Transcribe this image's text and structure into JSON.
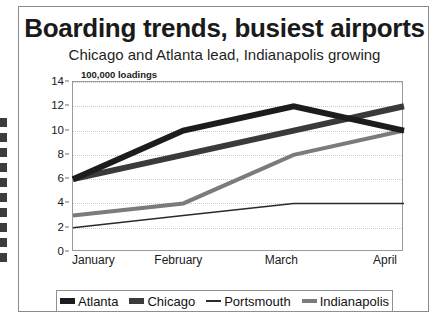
{
  "figure": {
    "title": "Boarding trends, busiest airports",
    "subtitle": "Chicago and Atlanta lead, Indianapolis growing",
    "unit_label": "100,000 loadings"
  },
  "chart_data": {
    "type": "line",
    "title": "Boarding trends, busiest airports",
    "subtitle": "Chicago and Atlanta lead, Indianapolis growing",
    "xlabel": "",
    "ylabel": "100,000 loadings",
    "categories": [
      "January",
      "February",
      "March",
      "April"
    ],
    "ylim": [
      0,
      14
    ],
    "yticks": [
      0,
      2,
      4,
      6,
      8,
      10,
      12,
      14
    ],
    "grid": true,
    "legend_position": "bottom",
    "series": [
      {
        "name": "Atlanta",
        "values": [
          6,
          10,
          12,
          10
        ],
        "color": "#1c1c1c",
        "width": 6
      },
      {
        "name": "Chicago",
        "values": [
          6,
          8,
          10,
          12
        ],
        "color": "#3a3a3a",
        "width": 6
      },
      {
        "name": "Portsmouth",
        "values": [
          2,
          3,
          4,
          4
        ],
        "color": "#2a2a2a",
        "width": 1.6
      },
      {
        "name": "Indianapolis",
        "values": [
          3,
          4,
          8,
          10
        ],
        "color": "#7b7b7b",
        "width": 4
      }
    ]
  }
}
